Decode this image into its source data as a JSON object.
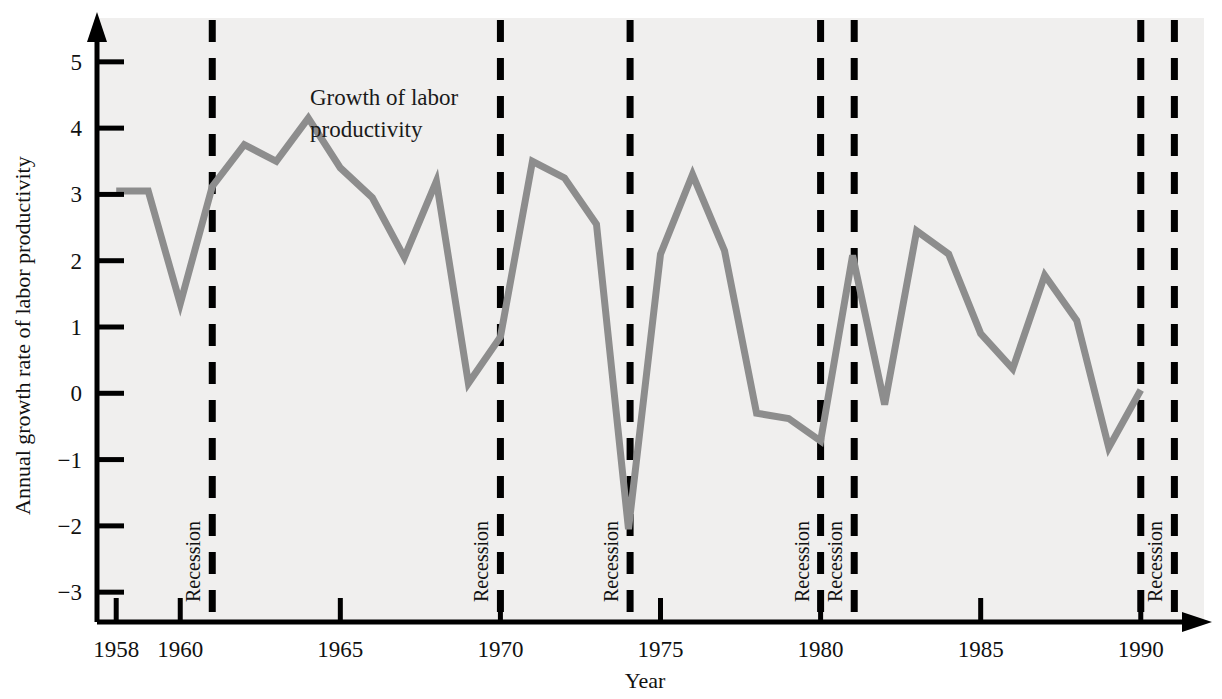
{
  "chart_data": {
    "type": "line",
    "title": "",
    "annotation": "Growth of labor productivity",
    "xlabel": "Year",
    "ylabel": "Annual growth rate of labor productivity",
    "xlim": [
      1957.4,
      1991.6
    ],
    "ylim": [
      -3.45,
      5.45
    ],
    "grid": false,
    "legend_position": "none",
    "line_color": "#8d8d8d",
    "axis_color": "#000000",
    "plot_background": "#f0efee",
    "page_background": "#ffffff",
    "xticks": [
      1958,
      1960,
      1965,
      1970,
      1975,
      1980,
      1985,
      1990
    ],
    "xtick_labels": [
      "1958",
      "1960",
      "1965",
      "1970",
      "1975",
      "1980",
      "1985",
      "1990"
    ],
    "yticks": [
      -3,
      -2,
      -1,
      0,
      1,
      2,
      3,
      4,
      5
    ],
    "ytick_labels": [
      "−3",
      "−2",
      "−1",
      "0",
      "1",
      "2",
      "3",
      "4",
      "5"
    ],
    "x": [
      1958,
      1959,
      1960,
      1961,
      1962,
      1963,
      1964,
      1965,
      1966,
      1967,
      1968,
      1969,
      1970,
      1971,
      1972,
      1973,
      1974,
      1975,
      1976,
      1977,
      1978,
      1979,
      1980,
      1981,
      1982,
      1983,
      1984,
      1985,
      1986,
      1987,
      1988,
      1989,
      1990
    ],
    "values": [
      3.05,
      3.05,
      1.35,
      3.12,
      3.75,
      3.5,
      4.15,
      3.4,
      2.95,
      2.05,
      3.2,
      0.15,
      0.85,
      3.5,
      3.25,
      2.55,
      -2.05,
      2.1,
      3.3,
      2.15,
      -0.3,
      -0.38,
      -0.72,
      2.08,
      -0.17,
      2.45,
      2.1,
      0.9,
      0.37,
      1.78,
      1.1,
      -0.82,
      0.05
    ],
    "series_name": "Growth of labor productivity",
    "recession_markers": [
      {
        "year": 1961.0,
        "label": "Recession"
      },
      {
        "year": 1970.0,
        "label": "Recession"
      },
      {
        "year": 1974.05,
        "label": "Recession"
      },
      {
        "year": 1980.0,
        "label": "Recession"
      },
      {
        "year": 1981.05,
        "label": "Recession"
      },
      {
        "year": 1991.05,
        "label": "Recession"
      },
      {
        "year": 1990.0,
        "label": ""
      }
    ]
  }
}
